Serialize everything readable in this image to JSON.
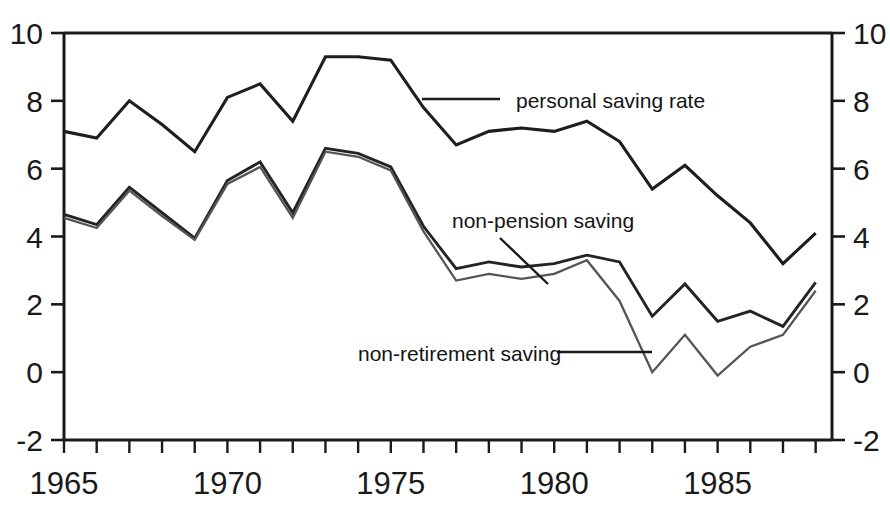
{
  "chart_data": {
    "type": "line",
    "title": "",
    "subtitle": "",
    "xlabel": "",
    "ylabel": "",
    "xlim": [
      1965,
      1988.5
    ],
    "ylim": [
      -2,
      10
    ],
    "grid": false,
    "legend_position": "inline-annotations",
    "y_ticks": [
      -2,
      0,
      2,
      4,
      6,
      8,
      10
    ],
    "y_tick_labels": [
      "-2",
      "0",
      "2",
      "4",
      "6",
      "8",
      "10"
    ],
    "y_axis_right_mirror": true,
    "x_ticks": [
      1965,
      1966,
      1967,
      1968,
      1969,
      1970,
      1971,
      1972,
      1973,
      1974,
      1975,
      1976,
      1977,
      1978,
      1979,
      1980,
      1981,
      1982,
      1983,
      1984,
      1985,
      1986,
      1987,
      1988
    ],
    "x_labeled_ticks": [
      1965,
      1970,
      1975,
      1980,
      1985
    ],
    "x_tick_labels": [
      "1965",
      "1970",
      "1975",
      "1980",
      "1985"
    ],
    "x": [
      1965,
      1966,
      1967,
      1968,
      1969,
      1970,
      1971,
      1972,
      1973,
      1974,
      1975,
      1976,
      1977,
      1978,
      1979,
      1980,
      1981,
      1982,
      1983,
      1984,
      1985,
      1986,
      1987,
      1988
    ],
    "series": [
      {
        "name": "personal saving rate",
        "label": "personal saving rate",
        "values": [
          7.1,
          6.9,
          8.0,
          7.3,
          6.5,
          8.1,
          8.5,
          7.4,
          9.3,
          9.3,
          9.2,
          7.8,
          6.7,
          7.1,
          7.2,
          7.1,
          7.4,
          6.8,
          5.4,
          6.1,
          5.2,
          4.4,
          3.2,
          4.1
        ]
      },
      {
        "name": "non-pension saving",
        "label": "non-pension saving",
        "values": [
          4.65,
          4.35,
          5.45,
          4.7,
          3.95,
          5.65,
          6.2,
          4.7,
          6.6,
          6.45,
          6.05,
          4.3,
          3.05,
          3.25,
          3.1,
          3.2,
          3.45,
          3.25,
          1.65,
          2.6,
          1.5,
          1.8,
          1.35,
          2.65
        ]
      },
      {
        "name": "non-retirement saving",
        "label": "non-retirement saving",
        "values": [
          4.55,
          4.25,
          5.35,
          4.6,
          3.9,
          5.55,
          6.05,
          4.55,
          6.5,
          6.35,
          5.95,
          4.15,
          2.7,
          2.9,
          2.75,
          2.9,
          3.3,
          2.1,
          0.0,
          1.1,
          -0.1,
          0.75,
          1.1,
          2.4
        ]
      }
    ],
    "annotations": [
      {
        "name": "personal saving rate",
        "text": "personal saving rate",
        "text_x": 516,
        "text_y": 108,
        "leader_from_x": 422,
        "leader_from_y": 99,
        "leader_to_x": 500,
        "leader_to_y": 99
      },
      {
        "name": "non-pension saving",
        "text": "non-pension saving",
        "text_x": 452,
        "text_y": 228,
        "leader_from_x": 548,
        "leader_from_y": 284,
        "leader_to_x": 500,
        "leader_to_y": 238
      },
      {
        "name": "non-retirement saving",
        "text": "non-retirement saving",
        "text_x": 358,
        "text_y": 361,
        "leader_from_x": 557,
        "leader_from_y": 352,
        "leader_to_x": 652,
        "leader_to_y": 352
      }
    ],
    "colors": {
      "personal_saving_rate": "#1e1e1e",
      "non_pension_saving": "#242424",
      "non_retirement_saving": "#555555",
      "axis": "#1a1a1a",
      "background": "#ffffff"
    }
  }
}
